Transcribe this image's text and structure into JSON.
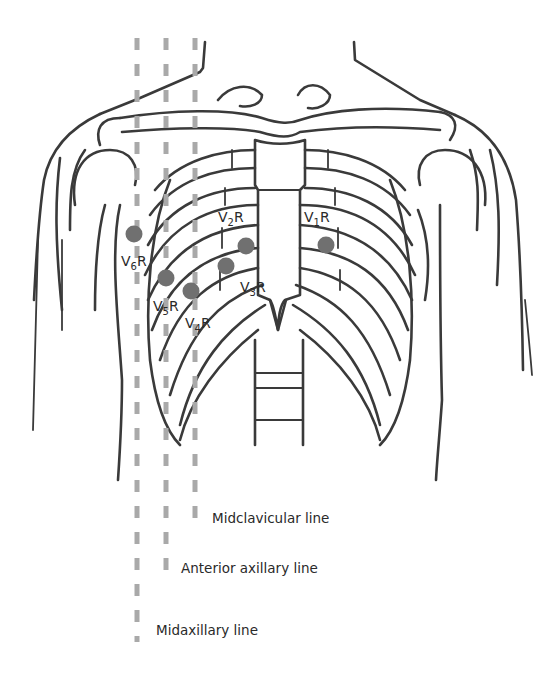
{
  "diagram": {
    "colors": {
      "outline": "#3a3a3a",
      "guide_line": "#a9a9a9",
      "electrode": "#707070",
      "background": "#ffffff"
    },
    "electrodes": [
      {
        "id": "V1R",
        "lead": "V",
        "sub": "1",
        "suffix": "R",
        "x": 326,
        "y": 245,
        "label_x": 304,
        "label_y": 222
      },
      {
        "id": "V2R",
        "lead": "V",
        "sub": "2",
        "suffix": "R",
        "x": 246,
        "y": 246,
        "label_x": 218,
        "label_y": 222
      },
      {
        "id": "V3R",
        "lead": "V",
        "sub": "3",
        "suffix": "R",
        "x": 226,
        "y": 266,
        "label_x": 240,
        "label_y": 292
      },
      {
        "id": "V4R",
        "lead": "V",
        "sub": "4",
        "suffix": "R",
        "x": 191,
        "y": 291,
        "label_x": 185,
        "label_y": 328
      },
      {
        "id": "V5R",
        "lead": "V",
        "sub": "5",
        "suffix": "R",
        "x": 166,
        "y": 278,
        "label_x": 153,
        "label_y": 311
      },
      {
        "id": "V6R",
        "lead": "V",
        "sub": "6",
        "suffix": "R",
        "x": 134,
        "y": 234,
        "label_x": 121,
        "label_y": 266
      }
    ],
    "guide_lines": [
      {
        "id": "midclavicular",
        "label": "Midclavicular line",
        "x": 195,
        "y_start": 38,
        "y_end": 524,
        "label_x": 212,
        "label_y": 521
      },
      {
        "id": "anterior-axillary",
        "label": "Anterior axillary line",
        "x": 166,
        "y_start": 38,
        "y_end": 574,
        "label_x": 181,
        "label_y": 571
      },
      {
        "id": "midaxillary",
        "label": "Midaxillary line",
        "x": 137,
        "y_start": 38,
        "y_end": 642,
        "label_x": 156,
        "label_y": 633
      }
    ]
  }
}
